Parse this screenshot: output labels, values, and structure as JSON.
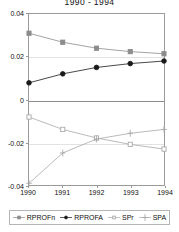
{
  "chart_data": {
    "type": "line",
    "title": "1990 - 1994",
    "xlabel": "",
    "ylabel": "",
    "x": [
      1990,
      1991,
      1992,
      1993,
      1994
    ],
    "categories": [
      "1990",
      "1991",
      "1992",
      "1993",
      "1994"
    ],
    "xlim": [
      1990,
      1994
    ],
    "ylim": [
      -0.04,
      0.04
    ],
    "yticks": [
      0.04,
      0.02,
      0,
      -0.02,
      -0.04
    ],
    "ytick_labels": [
      "0.04",
      "0.02",
      "0",
      "-0.02",
      "-0.04"
    ],
    "xticks": [
      1990,
      1991,
      1992,
      1993,
      1994
    ],
    "xtick_labels": [
      "1990",
      "1991",
      "1992",
      "1993",
      "1994"
    ],
    "grid": true,
    "zero_line": true,
    "legend_position": "bottom",
    "series": [
      {
        "name": "RPROFn",
        "values": [
          0.031,
          0.0268,
          0.024,
          0.0224,
          0.0214
        ],
        "color": "#8c8c8c",
        "marker": "square",
        "marker_filled": true
      },
      {
        "name": "RPROFA",
        "values": [
          0.0078,
          0.012,
          0.015,
          0.0168,
          0.018
        ],
        "color": "#1a1a1a",
        "marker": "circle",
        "marker_filled": true
      },
      {
        "name": "SPr",
        "values": [
          -0.0082,
          -0.014,
          -0.018,
          -0.021,
          -0.0232
        ],
        "color": "#a8a8a8",
        "marker": "square",
        "marker_filled": false
      },
      {
        "name": "SPA",
        "values": [
          -0.0392,
          -0.025,
          -0.0185,
          -0.0158,
          -0.014
        ],
        "color": "#a8a8a8",
        "marker": "plus",
        "marker_filled": false
      }
    ]
  },
  "legend": {
    "items": [
      {
        "label": "RPROFn"
      },
      {
        "label": "RPROFA"
      },
      {
        "label": "SPr"
      },
      {
        "label": "SPA"
      }
    ]
  }
}
